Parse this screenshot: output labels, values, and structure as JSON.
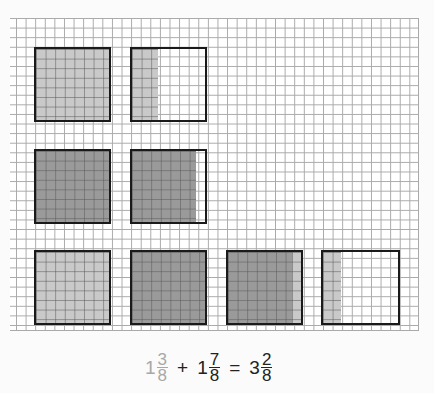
{
  "diagram": {
    "colors": {
      "first_addend": "#c9c9c9",
      "second_addend": "#9a9a9a",
      "outline": "#1a1a1a",
      "grid": "#a9a9a9"
    },
    "rows": [
      {
        "label": "first addend",
        "squares": [
          {
            "parts": [
              {
                "shade": "light",
                "eighths": 8
              }
            ]
          },
          {
            "parts": [
              {
                "shade": "light",
                "eighths": 3
              }
            ]
          }
        ]
      },
      {
        "label": "second addend",
        "squares": [
          {
            "parts": [
              {
                "shade": "dark",
                "eighths": 8
              }
            ]
          },
          {
            "parts": [
              {
                "shade": "dark",
                "eighths": 7
              }
            ]
          }
        ]
      },
      {
        "label": "sum",
        "squares": [
          {
            "parts": [
              {
                "shade": "light",
                "eighths": 8
              }
            ]
          },
          {
            "parts": [
              {
                "shade": "dark",
                "eighths": 8
              }
            ]
          },
          {
            "parts": [
              {
                "shade": "dark",
                "eighths": 7
              },
              {
                "shade": "light",
                "eighths": 1
              }
            ]
          },
          {
            "parts": [
              {
                "shade": "light",
                "eighths": 2
              }
            ]
          }
        ]
      }
    ]
  },
  "equation": {
    "term1": {
      "whole": "1",
      "num": "3",
      "den": "8"
    },
    "plus": "+",
    "term2": {
      "whole": "1",
      "num": "7",
      "den": "8"
    },
    "equals": "=",
    "result": {
      "whole": "3",
      "num": "2",
      "den": "8"
    }
  }
}
